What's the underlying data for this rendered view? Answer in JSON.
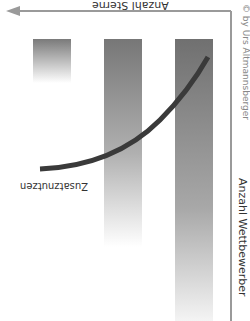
{
  "diagram": {
    "orientation": "rotated 180 degrees",
    "x_axis_label": "Anzahl Sterne",
    "y_axis_label": "Anzahl Wettbewerber",
    "curve_label": "Zusatznutzen",
    "copyright": "© by Urs Altmannsberger",
    "bars": [
      {
        "id": "bar-1",
        "relative_height": "short"
      },
      {
        "id": "bar-2",
        "relative_height": "medium"
      },
      {
        "id": "bar-3",
        "relative_height": "tall"
      }
    ],
    "colors": {
      "bar_top": "#7a7a7a",
      "axis": "#9a9a9a",
      "curve": "#3a3a3a",
      "text": "#333333"
    }
  }
}
